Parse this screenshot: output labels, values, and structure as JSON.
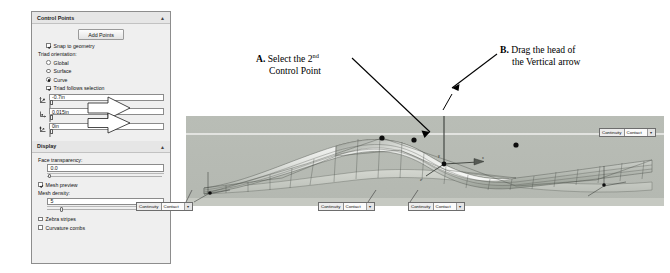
{
  "panel": {
    "control_points": {
      "title": "Control Points",
      "collapse_icon": "chevron-up-icon",
      "add_points_label": "Add Points",
      "snap_to_geometry_label": "Snap to geometry",
      "snap_to_geometry_checked": true,
      "triad_orientation_label": "Triad orientation:",
      "options": [
        {
          "label": "Global",
          "selected": false
        },
        {
          "label": "Surface",
          "selected": false
        },
        {
          "label": "Curve",
          "selected": true
        }
      ],
      "triad_follows_selection_label": "Triad follows selection",
      "triad_follows_selection_checked": true,
      "coordinate_fields": [
        {
          "icon": "triad-x-icon",
          "value": "-0.7in"
        },
        {
          "icon": "triad-y-icon",
          "value": "0.015in"
        },
        {
          "icon": "triad-z-icon",
          "value": "0in"
        }
      ]
    },
    "display": {
      "title": "Display",
      "collapse_icon": "chevron-up-icon",
      "face_transparency_label": "Face transparency:",
      "face_transparency_value": "0.0",
      "mesh_preview_label": "Mesh preview",
      "mesh_preview_checked": true,
      "mesh_density_label": "Mesh density:",
      "mesh_density_value": "5",
      "zebra_stripes_label": "Zebra stripes",
      "zebra_stripes_checked": false,
      "curvature_combs_label": "Curvature combs",
      "curvature_combs_checked": false
    }
  },
  "annotations": [
    {
      "marker": "A.",
      "line1": "Select the 2",
      "superscript": "nd",
      "line2": "Control Point"
    },
    {
      "marker": "B.",
      "line1": "Drag the head of",
      "line2": "the Vertical arrow"
    }
  ],
  "viewport": {
    "axis_labels": {
      "y": "y",
      "x": "x",
      "z": "z"
    },
    "continuity_callouts": [
      {
        "label": "Continuity",
        "value": "Contact",
        "arrow": "chevron-down-icon"
      },
      {
        "label": "Continuity",
        "value": "Contact",
        "arrow": "chevron-down-icon"
      },
      {
        "label": "Continuity",
        "value": "Contact",
        "arrow": "chevron-down-icon"
      },
      {
        "label": "Continuity",
        "value": "Contact",
        "arrow": "chevron-down-icon"
      }
    ]
  },
  "colors": {
    "panel_bg": "#efefef",
    "panel_border": "#8d8d8d",
    "viewport_bg": "#b9bdb6",
    "surface_light": "#f2f3f1",
    "surface_dark": "#8f938d",
    "control_point": "#101010",
    "annotation_text": "#000000"
  }
}
